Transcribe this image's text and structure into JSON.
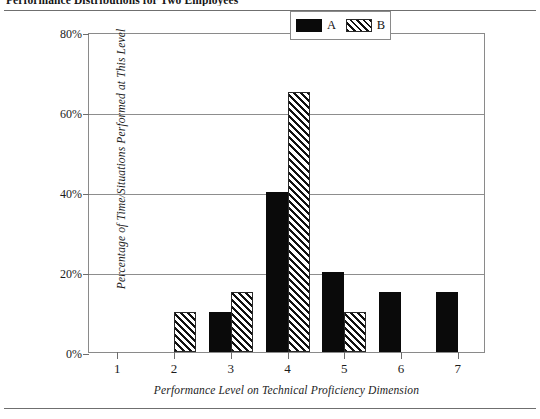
{
  "figure": {
    "caption": "Performance Distributions for Two Employees"
  },
  "chart_data": {
    "type": "bar",
    "title": "",
    "xlabel": "Performance Level on Technical Proficiency Dimension",
    "ylabel": "Percentage of Time/Situations Performed at This Level",
    "categories": [
      "1",
      "2",
      "3",
      "4",
      "5",
      "6",
      "7"
    ],
    "series": [
      {
        "name": "A",
        "fill": "solid",
        "values": [
          0,
          0,
          10,
          40,
          20,
          15,
          15
        ]
      },
      {
        "name": "B",
        "fill": "hatched",
        "values": [
          0,
          10,
          15,
          65,
          10,
          0,
          0
        ]
      }
    ],
    "ylim": [
      0,
      80
    ],
    "yticks": [
      "0%",
      "20%",
      "40%",
      "60%",
      "80%"
    ],
    "ytick_values": [
      0,
      20,
      40,
      60,
      80
    ],
    "grid": true,
    "legend_position": "top-right",
    "legend": [
      "A",
      "B"
    ]
  },
  "legend": {
    "entries": [
      {
        "label": "A",
        "pattern": "solid-black"
      },
      {
        "label": "B",
        "pattern": "diagonal-hatch"
      }
    ]
  }
}
